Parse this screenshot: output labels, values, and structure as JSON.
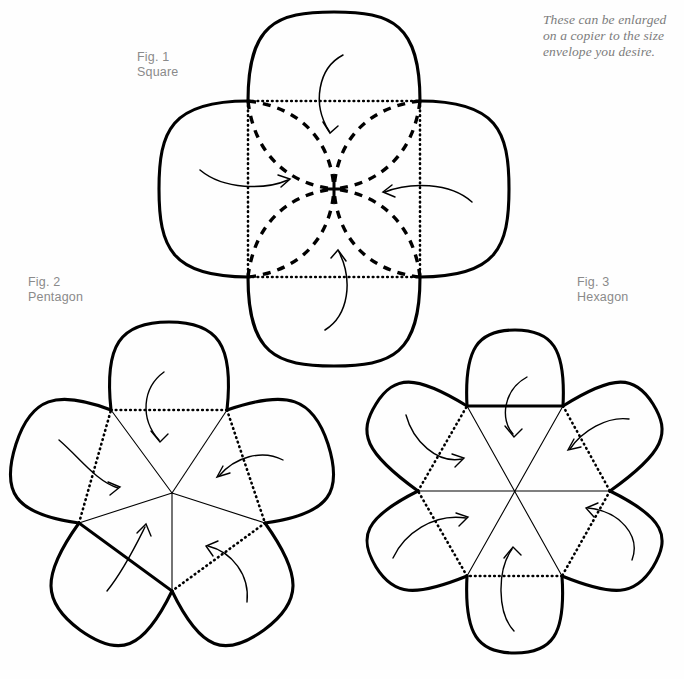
{
  "page": {
    "background_color": "#fefefe",
    "ink_color": "#000000",
    "label_color": "#8a8a8a",
    "note_color": "#7c7c7c",
    "width": 684,
    "height": 679
  },
  "note": {
    "text": "These can be enlarged on a copier to the size envelope you desire."
  },
  "figures": [
    {
      "id": "fig1",
      "caption_line1": "Fig. 1",
      "caption_line2": "Square",
      "sides": 4,
      "center": {
        "x": 334,
        "y": 189
      },
      "radius": 123,
      "fold_style": "dotted",
      "interior_style": "dashed-pinwheel",
      "petals": 4,
      "arrows": 4
    },
    {
      "id": "fig2",
      "caption_line1": "Fig. 2",
      "caption_line2": "Pentagon",
      "sides": 5,
      "center": {
        "x": 172,
        "y": 493
      },
      "radius": 98,
      "fold_style": "mixed-dotted-solid",
      "interior_style": "radial-spokes",
      "petals": 5,
      "arrows": 5
    },
    {
      "id": "fig3",
      "caption_line1": "Fig. 3",
      "caption_line2": "Hexagon",
      "sides": 6,
      "center": {
        "x": 514,
        "y": 491
      },
      "radius": 96,
      "fold_style": "mixed-dotted-solid",
      "interior_style": "long-diagonals",
      "petals": 6,
      "arrows": 6
    }
  ]
}
